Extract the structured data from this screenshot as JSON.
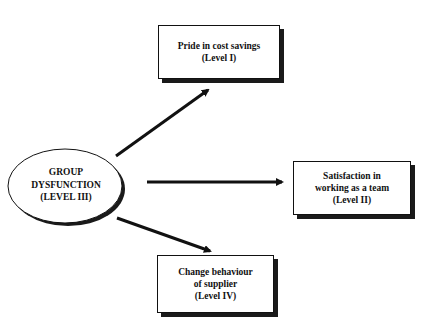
{
  "diagram": {
    "center_node": {
      "lines": [
        "GROUP",
        "DYSFUNCTION",
        "(LEVEL III)"
      ]
    },
    "nodes": [
      {
        "id": "level-i",
        "lines": [
          "Pride in cost savings",
          "(Level I)"
        ]
      },
      {
        "id": "level-ii",
        "lines": [
          "Satisfaction in",
          "working as a team",
          "(Level II)"
        ]
      },
      {
        "id": "level-iv",
        "lines": [
          "Change behaviour",
          "of supplier",
          "(Level IV)"
        ]
      }
    ],
    "edges": [
      {
        "from": "center",
        "to": "level-i"
      },
      {
        "from": "center",
        "to": "level-ii"
      },
      {
        "from": "center",
        "to": "level-iv"
      }
    ]
  }
}
